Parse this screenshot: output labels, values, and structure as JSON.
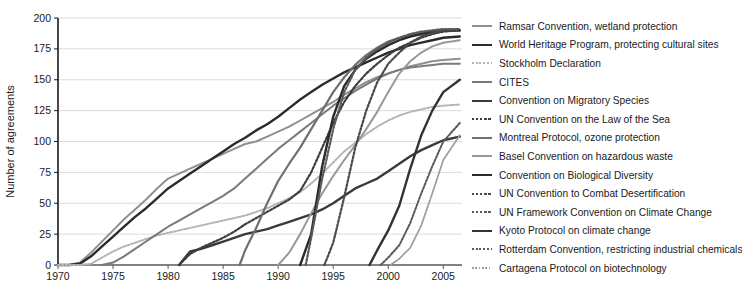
{
  "chart_data": {
    "type": "line",
    "title": "",
    "xlabel": "",
    "ylabel": "Number of agreements",
    "xlim": [
      1970,
      2006.7
    ],
    "ylim": [
      0,
      200
    ],
    "grid": "horizontal",
    "legend_position": "right",
    "x_ticks": [
      "1970",
      "1975",
      "1980",
      "1985",
      "1990",
      "1995",
      "2000",
      "2005"
    ],
    "x_tick_values": [
      1970,
      1975,
      1980,
      1985,
      1990,
      1995,
      2000,
      2005
    ],
    "y_ticks": [
      "0",
      "25",
      "50",
      "75",
      "100",
      "125",
      "150",
      "175",
      "200"
    ],
    "y_tick_values": [
      0,
      25,
      50,
      75,
      100,
      125,
      150,
      175,
      200
    ],
    "series": [
      {
        "name": "Ramsar Convention, wetland protection",
        "color": "#8f8f8f",
        "style": "solid",
        "width": 2.0,
        "x": [
          1970,
          1971,
          1972,
          1973,
          1974,
          1975,
          1976,
          1977,
          1978,
          1979,
          1980,
          1981,
          1982,
          1983,
          1984,
          1985,
          1986,
          1987,
          1988,
          1989,
          1990,
          1991,
          1992,
          1993,
          1994,
          1995,
          1996,
          1997,
          1998,
          1999,
          2000,
          2001,
          2002,
          2003,
          2004,
          2005,
          2006.5
        ],
        "y": [
          0,
          0,
          2,
          10,
          19,
          28,
          37,
          45,
          53,
          62,
          70,
          74,
          78,
          82,
          86,
          90,
          94,
          98,
          100,
          104,
          108,
          112,
          117,
          122,
          127,
          132,
          138,
          143,
          148,
          152,
          155,
          158,
          161,
          163,
          165,
          166,
          167
        ]
      },
      {
        "name": "World Heritage Program, protecting cultural sites",
        "color": "#2b2b2b",
        "style": "solid",
        "width": 2.4,
        "x": [
          1970,
          1971,
          1972,
          1973,
          1974,
          1975,
          1976,
          1977,
          1978,
          1979,
          1980,
          1981,
          1982,
          1983,
          1984,
          1985,
          1986,
          1987,
          1988,
          1989,
          1990,
          1991,
          1992,
          1993,
          1994,
          1995,
          1996,
          1997,
          1998,
          1999,
          2000,
          2001,
          2002,
          2003,
          2004,
          2005,
          2006.5
        ],
        "y": [
          0,
          0,
          1,
          7,
          15,
          23,
          31,
          39,
          46,
          54,
          62,
          68,
          74,
          80,
          86,
          92,
          98,
          103,
          109,
          114,
          120,
          127,
          134,
          140,
          146,
          151,
          156,
          160,
          164,
          168,
          172,
          175,
          178,
          180,
          182,
          184,
          185
        ]
      },
      {
        "name": "Stockholm Declaration",
        "color": "#b4b4b4",
        "style": "dotted",
        "width": 2.0,
        "x": [
          1970,
          1971,
          1972,
          1973,
          1974,
          1975,
          1976,
          1977,
          1978,
          1979,
          1980,
          1981,
          1982,
          1983,
          1984,
          1985,
          1986,
          1987,
          1988,
          1989,
          1990,
          1991,
          1992,
          1993,
          1994,
          1995,
          1996,
          1997,
          1998,
          1999,
          2000,
          2001,
          2002,
          2003,
          2004,
          2005,
          2006.5
        ],
        "y": [
          0,
          0,
          0,
          1,
          6,
          11,
          15,
          18,
          21,
          24,
          26,
          28,
          30,
          32,
          34,
          36,
          38,
          40,
          43,
          46,
          50,
          54,
          59,
          66,
          74,
          83,
          92,
          99,
          106,
          112,
          117,
          121,
          124,
          126,
          128,
          129,
          130
        ]
      },
      {
        "name": "CITES",
        "color": "#7a7a7a",
        "style": "solid",
        "width": 2.0,
        "x": [
          1974,
          1975,
          1976,
          1977,
          1978,
          1979,
          1980,
          1981,
          1982,
          1983,
          1984,
          1985,
          1986,
          1987,
          1988,
          1989,
          1990,
          1991,
          1992,
          1993,
          1994,
          1995,
          1996,
          1997,
          1998,
          1999,
          2000,
          2001,
          2002,
          2003,
          2004,
          2005,
          2006.5
        ],
        "y": [
          0,
          2,
          7,
          13,
          19,
          25,
          31,
          36,
          41,
          46,
          51,
          56,
          62,
          70,
          78,
          86,
          94,
          101,
          108,
          115,
          122,
          129,
          135,
          141,
          146,
          151,
          155,
          158,
          160,
          161,
          162,
          163,
          163
        ]
      },
      {
        "name": "Convention on Migratory Species",
        "color": "#3a3a3a",
        "style": "solid",
        "width": 2.4,
        "x": [
          1981,
          1982,
          1983,
          1984,
          1985,
          1986,
          1987,
          1988,
          1989,
          1990,
          1991,
          1992,
          1993,
          1994,
          1995,
          1996,
          1997,
          1998,
          1999,
          2000,
          2001,
          2002,
          2003,
          2004,
          2005,
          2006.5
        ],
        "y": [
          0,
          11,
          13,
          16,
          19,
          22,
          25,
          27,
          29,
          32,
          35,
          38,
          41,
          45,
          50,
          56,
          62,
          66,
          70,
          76,
          82,
          88,
          93,
          97,
          101,
          104
        ]
      },
      {
        "name": "UN Convention on the Law of the Sea",
        "color": "#3d3d3d",
        "style": "dotted",
        "width": 2.2,
        "x": [
          1981,
          1982,
          1983,
          1984,
          1985,
          1986,
          1987,
          1988,
          1989,
          1990,
          1991,
          1992,
          1993,
          1994,
          1995,
          1996,
          1997,
          1998,
          1999,
          2000,
          2001,
          2002,
          2003,
          2004,
          2005,
          2006.5
        ],
        "y": [
          0,
          9,
          14,
          18,
          22,
          27,
          33,
          38,
          43,
          48,
          53,
          60,
          75,
          95,
          115,
          132,
          145,
          155,
          163,
          170,
          176,
          180,
          184,
          187,
          189,
          190
        ]
      },
      {
        "name": "Montreal Protocol, ozone protection",
        "color": "#707070",
        "style": "solid",
        "width": 2.2,
        "x": [
          1986.5,
          1987,
          1988,
          1989,
          1990,
          1991,
          1992,
          1993,
          1994,
          1995,
          1996,
          1997,
          1998,
          1999,
          2000,
          2001,
          2002,
          2003,
          2004,
          2005,
          2006.5
        ],
        "y": [
          0,
          12,
          30,
          50,
          68,
          82,
          95,
          110,
          125,
          140,
          152,
          162,
          170,
          176,
          181,
          184,
          186,
          188,
          189,
          190,
          190
        ]
      },
      {
        "name": "Basel Convention on hazardous waste",
        "color": "#999999",
        "style": "solid",
        "width": 2.0,
        "x": [
          1990,
          1991,
          1992,
          1993,
          1994,
          1995,
          1996,
          1997,
          1998,
          1999,
          2000,
          2001,
          2002,
          2003,
          2004,
          2005,
          2006.5
        ],
        "y": [
          0,
          10,
          25,
          42,
          58,
          72,
          85,
          97,
          110,
          124,
          140,
          155,
          165,
          172,
          177,
          180,
          182
        ]
      },
      {
        "name": "Convention on Biological Diversity",
        "color": "#2b2b2b",
        "style": "solid",
        "width": 2.4,
        "x": [
          1992,
          1993,
          1994,
          1995,
          1996,
          1997,
          1998,
          1999,
          2000,
          2001,
          2002,
          2003,
          2004,
          2005,
          2006.5
        ],
        "y": [
          0,
          25,
          80,
          120,
          145,
          158,
          167,
          173,
          178,
          182,
          185,
          187,
          189,
          190,
          190
        ]
      },
      {
        "name": "UN Convention to Combat Desertification",
        "color": "#4a4a4a",
        "style": "dotted",
        "width": 2.2,
        "x": [
          1994.2,
          1995,
          1996,
          1997,
          1998,
          1999,
          2000,
          2001,
          2002,
          2003,
          2004,
          2005,
          2006.5
        ],
        "y": [
          0,
          18,
          55,
          95,
          125,
          148,
          163,
          172,
          180,
          185,
          188,
          190,
          191
        ]
      },
      {
        "name": "UN Framework Convention on Climate Change",
        "color": "#5a5a5a",
        "style": "dotted",
        "width": 2.2,
        "x": [
          1992.5,
          1993,
          1994,
          1995,
          1996,
          1997,
          1998,
          1999,
          2000,
          2001,
          2002,
          2003,
          2004,
          2005,
          2006.5
        ],
        "y": [
          0,
          22,
          70,
          110,
          140,
          158,
          168,
          175,
          180,
          184,
          187,
          189,
          190,
          191,
          191
        ]
      },
      {
        "name": "Kyoto Protocol on climate change",
        "color": "#333333",
        "style": "solid",
        "width": 2.4,
        "x": [
          1998.3,
          1999,
          2000,
          2001,
          2002,
          2003,
          2004,
          2005,
          2006.5
        ],
        "y": [
          0,
          12,
          28,
          48,
          78,
          105,
          125,
          140,
          150
        ]
      },
      {
        "name": "Rotterdam Convention, restricting industrial chemicals",
        "color": "#5a5a5a",
        "style": "dotted",
        "width": 2.0,
        "x": [
          1999.3,
          2000,
          2001,
          2002,
          2003,
          2004,
          2005,
          2006.5
        ],
        "y": [
          0,
          6,
          16,
          34,
          58,
          80,
          100,
          115
        ]
      },
      {
        "name": "Cartagena Protocol on biotechnology",
        "color": "#9d9d9d",
        "style": "dotted",
        "width": 1.8,
        "x": [
          2000.2,
          2001,
          2002,
          2003,
          2004,
          2005,
          2006.5
        ],
        "y": [
          0,
          5,
          14,
          32,
          58,
          85,
          105
        ]
      }
    ]
  }
}
